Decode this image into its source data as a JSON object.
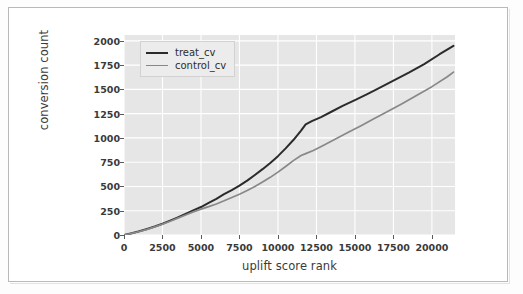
{
  "chart_data": {
    "type": "line",
    "title": "",
    "xlabel": "uplift score rank",
    "ylabel": "conversion count",
    "xlim": [
      0,
      21500
    ],
    "ylim": [
      0,
      2060
    ],
    "xticks": [
      0,
      2500,
      5000,
      7500,
      10000,
      12500,
      15000,
      17500,
      20000
    ],
    "xtick_labels": [
      "0",
      "2500",
      "5000",
      "7500",
      "10000",
      "12500",
      "15000",
      "17500",
      "20000"
    ],
    "yticks": [
      0,
      250,
      500,
      750,
      1000,
      1250,
      1500,
      1750,
      2000
    ],
    "ytick_labels": [
      "0",
      "250",
      "500",
      "750",
      "1000",
      "1250",
      "1500",
      "1750",
      "2000"
    ],
    "grid": true,
    "grid_color": "#ffffff",
    "axes_facecolor": "#e6e6e6",
    "figure_facecolor": "#ffffff",
    "legend_position": "upper left",
    "series": [
      {
        "name": "treat_cv",
        "color": "#2b2b2b",
        "linewidth": 2.0,
        "x": [
          0,
          500,
          1000,
          1500,
          2000,
          2500,
          3000,
          3500,
          4000,
          4500,
          5000,
          5500,
          6000,
          6500,
          7000,
          7500,
          8000,
          8500,
          9000,
          9500,
          10000,
          10500,
          11000,
          11500,
          11800,
          12200,
          12800,
          13500,
          14200,
          15000,
          15800,
          16500,
          17500,
          18500,
          19500,
          20500,
          21400
        ],
        "y": [
          0,
          18,
          38,
          62,
          88,
          116,
          148,
          182,
          218,
          254,
          288,
          330,
          372,
          420,
          462,
          508,
          560,
          618,
          678,
          742,
          812,
          892,
          978,
          1075,
          1140,
          1172,
          1215,
          1272,
          1330,
          1390,
          1452,
          1508,
          1590,
          1672,
          1760,
          1862,
          1948
        ]
      },
      {
        "name": "control_cv",
        "color": "#888888",
        "linewidth": 1.7,
        "x": [
          0,
          500,
          1000,
          1500,
          2000,
          2500,
          3000,
          3500,
          4000,
          4500,
          5000,
          5500,
          6000,
          6500,
          7000,
          7500,
          8000,
          8500,
          9000,
          9500,
          10000,
          10500,
          11000,
          11500,
          11800,
          12300,
          13000,
          13800,
          14600,
          15400,
          16200,
          17000,
          18000,
          19000,
          20000,
          21000,
          21400
        ],
        "y": [
          0,
          17,
          36,
          58,
          84,
          112,
          142,
          174,
          206,
          238,
          266,
          292,
          320,
          352,
          386,
          420,
          458,
          500,
          545,
          594,
          648,
          706,
          766,
          818,
          838,
          870,
          928,
          994,
          1060,
          1126,
          1194,
          1262,
          1348,
          1438,
          1528,
          1630,
          1678
        ]
      }
    ]
  }
}
